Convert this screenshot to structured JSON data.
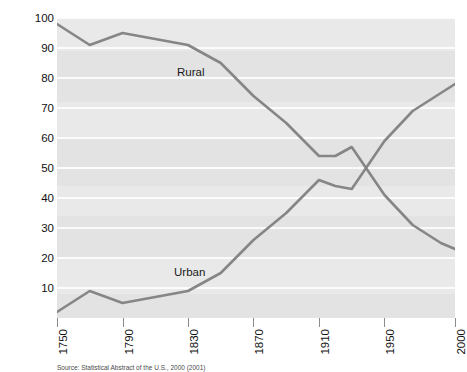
{
  "chart_data": {
    "type": "line",
    "title": "",
    "subtitle": "",
    "xlabel": "",
    "ylabel": "Percent of population",
    "xlim": [
      1750,
      2000
    ],
    "ylim": [
      0,
      100
    ],
    "grid": true,
    "legend_position": "inline-annotations",
    "xtick_labels": [
      "1750",
      "1790",
      "1830",
      "1870",
      "1910",
      "1950",
      "2000"
    ],
    "xtick_values": [
      1750,
      1790,
      1830,
      1870,
      1910,
      1950,
      2000
    ],
    "ytick_labels": [
      "10",
      "20",
      "30",
      "40",
      "50",
      "60",
      "70",
      "80",
      "90",
      "100"
    ],
    "ytick_values": [
      10,
      20,
      30,
      40,
      50,
      60,
      70,
      80,
      90,
      100
    ],
    "annotations": [
      {
        "text": "Rural",
        "x": 1830,
        "y": 84
      },
      {
        "text": "Urban",
        "x": 1825,
        "y": 17
      }
    ],
    "series": [
      {
        "name": "Rural",
        "color": "#868686",
        "x": [
          1750,
          1770,
          1790,
          1810,
          1830,
          1850,
          1870,
          1890,
          1910,
          1920,
          1930,
          1950,
          1970,
          1990,
          2000
        ],
        "values": [
          98,
          91,
          95,
          93,
          91,
          85,
          74,
          65,
          54,
          54,
          57,
          41,
          31,
          25,
          23
        ]
      },
      {
        "name": "Urban",
        "color": "#868686",
        "x": [
          1750,
          1770,
          1790,
          1810,
          1830,
          1850,
          1870,
          1890,
          1910,
          1920,
          1930,
          1950,
          1970,
          1990,
          2000
        ],
        "values": [
          2,
          9,
          5,
          7,
          9,
          15,
          26,
          35,
          46,
          44,
          43,
          59,
          69,
          75,
          78
        ]
      }
    ]
  },
  "axis": {
    "ylabel": "Percent of population"
  },
  "caption": {
    "text": "Source: Statistical Abstract of the U.S., 2000 (2001)"
  }
}
